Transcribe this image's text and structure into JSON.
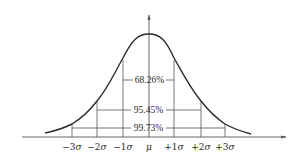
{
  "diagram": {
    "title": "",
    "type": "normal-distribution",
    "colors": {
      "curve": "#2b2b2b",
      "lines": "#555555",
      "text": "#2a2a2a",
      "background": "#ffffff"
    },
    "x_ticks": [
      {
        "prefix": "−3",
        "symbol": "σ"
      },
      {
        "prefix": "−2",
        "symbol": "σ"
      },
      {
        "prefix": "−1",
        "symbol": "σ"
      },
      {
        "prefix": "",
        "symbol": "μ"
      },
      {
        "prefix": "+1",
        "symbol": "σ"
      },
      {
        "prefix": "+2",
        "symbol": "σ"
      },
      {
        "prefix": "+3",
        "symbol": "σ"
      }
    ],
    "intervals": [
      {
        "range": "±1σ",
        "label": "68.26%"
      },
      {
        "range": "±2σ",
        "label": "95.45%"
      },
      {
        "range": "±3σ",
        "label": "99.73%"
      }
    ]
  }
}
